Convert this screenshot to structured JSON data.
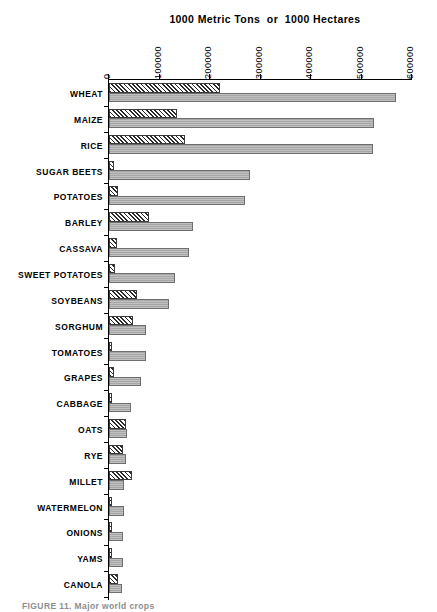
{
  "chart_data": {
    "type": "bar",
    "orientation": "horizontal",
    "title": "1000 Metric Tons  or  1000 Hectares",
    "xlabel": "",
    "ylabel": "",
    "xlim": [
      0,
      600000
    ],
    "xticks": [
      0,
      100000,
      200000,
      300000,
      400000,
      500000,
      600000
    ],
    "xtick_labels": [
      "0",
      "100000",
      "200000",
      "300000",
      "400000",
      "500000",
      "600000"
    ],
    "grid": false,
    "legend": "none",
    "tick_label_rotation": 90,
    "categories": [
      "WHEAT",
      "MAIZE",
      "RICE",
      "SUGAR BEETS",
      "POTATOES",
      "BARLEY",
      "CASSAVA",
      "SWEET POTATOES",
      "SOYBEANS",
      "SORGHUM",
      "TOMATOES",
      "GRAPES",
      "CABBAGE",
      "OATS",
      "RYE",
      "MILLET",
      "WATERMELON",
      "ONIONS",
      "YAMS",
      "CANOLA"
    ],
    "series": [
      {
        "name": "1000 Hectares",
        "pattern": "hatched",
        "color": "#2b2b2b",
        "values": [
          220000,
          135000,
          150000,
          9000,
          18000,
          79000,
          15000,
          12000,
          55000,
          47000,
          3000,
          9000,
          2000,
          34000,
          27000,
          45000,
          2000,
          2000,
          3000,
          18000
        ]
      },
      {
        "name": "1000 Metric Tons",
        "pattern": "solid",
        "color": "#a6a6a6",
        "values": [
          568000,
          525000,
          522000,
          280000,
          270000,
          166000,
          158000,
          130000,
          119000,
          73000,
          73000,
          63000,
          44000,
          36000,
          33000,
          30000,
          29000,
          28000,
          27000,
          26000
        ]
      }
    ]
  },
  "caption": "FIGURE 11.  Major world crops"
}
